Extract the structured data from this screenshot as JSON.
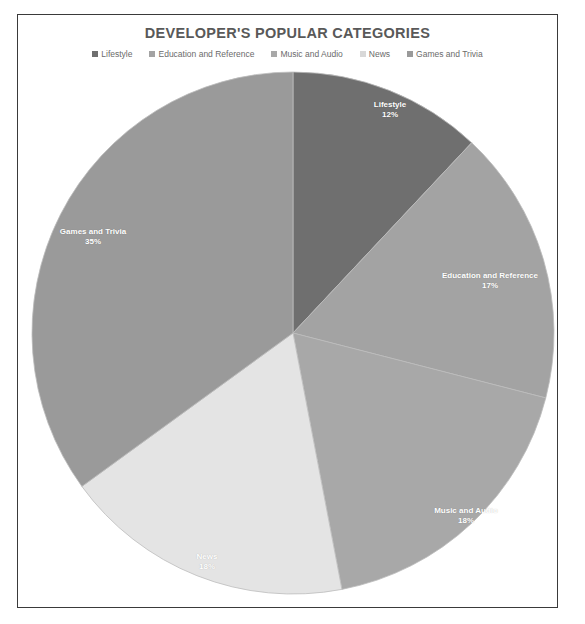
{
  "chart": {
    "title": "DEVELOPER'S POPULAR CATEGORIES",
    "frame_border_color": "#3a3a3a",
    "background_color": "#ffffff",
    "title_color": "#595959",
    "legend_text_color": "#6b6b6b"
  },
  "chart_data": {
    "type": "pie",
    "title": "DEVELOPER'S POPULAR CATEGORIES",
    "xlabel": "",
    "ylabel": "",
    "legend_position": "top",
    "grid": false,
    "start_angle_deg": 0,
    "direction": "clockwise",
    "categories": [
      "Lifestyle",
      "Education and Reference",
      "Music and Audio",
      "News",
      "Games and Trivia"
    ],
    "values": [
      12,
      17,
      18,
      18,
      35
    ],
    "value_unit": "%",
    "colors": [
      "#6f6f6f",
      "#a3a3a3",
      "#a8a8a8",
      "#e4e4e4",
      "#9a9a9a"
    ],
    "slices": [
      {
        "label": "Lifestyle",
        "value": 12,
        "display": "12%",
        "color": "#6f6f6f",
        "label_x": 390,
        "label_y": 110
      },
      {
        "label": "Education and Reference",
        "value": 17,
        "display": "17%",
        "color": "#a3a3a3",
        "label_x": 490,
        "label_y": 281
      },
      {
        "label": "Music and Audio",
        "value": 18,
        "display": "18%",
        "color": "#a8a8a8",
        "label_x": 466,
        "label_y": 516
      },
      {
        "label": "News",
        "value": 18,
        "display": "18%",
        "color": "#e4e4e4",
        "label_x": 207,
        "label_y": 562
      },
      {
        "label": "Games and Trivia",
        "value": 35,
        "display": "35%",
        "color": "#9a9a9a",
        "label_x": 93,
        "label_y": 237
      }
    ]
  },
  "legend": {
    "items": [
      {
        "label": "Lifestyle",
        "color": "#6f6f6f"
      },
      {
        "label": "Education and Reference",
        "color": "#a3a3a3"
      },
      {
        "label": "Music and Audio",
        "color": "#a8a8a8"
      },
      {
        "label": "News",
        "color": "#d8d8d8"
      },
      {
        "label": "Games and Trivia",
        "color": "#9a9a9a"
      }
    ]
  },
  "geometry": {
    "center_x": 293,
    "center_y": 333,
    "radius": 261
  }
}
